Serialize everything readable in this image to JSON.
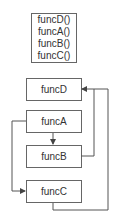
{
  "call_stack": [
    "funcD()",
    "funcA()",
    "funcB()",
    "funcC()"
  ],
  "nodes": {
    "funcD": "funcD",
    "funcA": "funcA",
    "funcB": "funcB",
    "funcC": "funcC"
  },
  "edges": [
    {
      "from": "funcA",
      "to": "funcB"
    },
    {
      "from": "funcA",
      "to": "funcC"
    },
    {
      "from": "funcB",
      "to": "funcD"
    },
    {
      "from": "funcC",
      "to": "funcD"
    }
  ],
  "colors": {
    "line": "#555555",
    "border": "#666666",
    "text": "#333333"
  }
}
